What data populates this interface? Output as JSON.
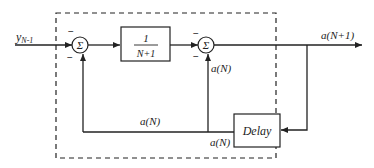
{
  "diagram": {
    "input_label": "y",
    "input_subscript": "N-1",
    "sum1": {
      "symbol": "Σ",
      "sign_top": "−",
      "sign_bottom": "−"
    },
    "gain_block": {
      "numerator": "1",
      "denominator": "N+1"
    },
    "sum2": {
      "symbol": "Σ",
      "sign_top": "−",
      "sign_bottom": "−"
    },
    "output_label": "a(N+1)",
    "feedback_label_vertical": "a(N)",
    "feedback_label_bottom": "a(N)",
    "delay_output_label": "a(N)",
    "delay_block": {
      "label": "Delay"
    }
  }
}
